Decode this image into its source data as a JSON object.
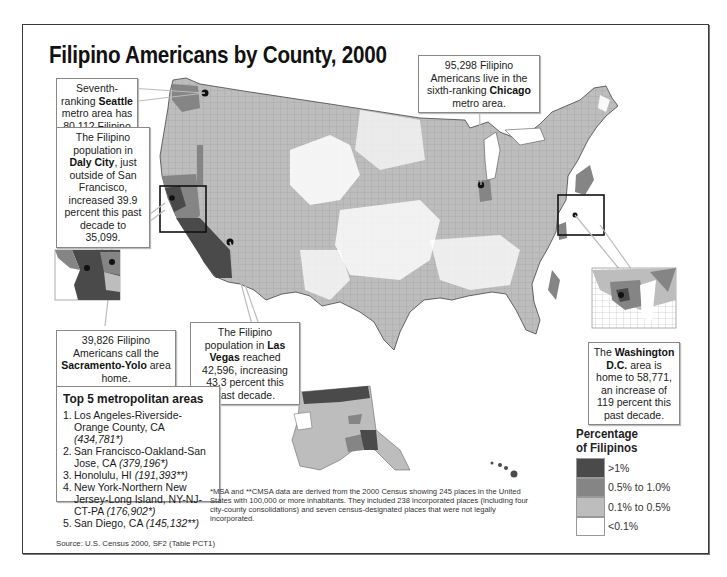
{
  "title": "Filipino Americans by County, 2000",
  "callouts": {
    "seattle": {
      "pre": "Seventh-ranking ",
      "bold": "Seattle",
      "post": " metro area has 80,112 Filipino Americans."
    },
    "daly_city": {
      "pre": "The Filipino population in ",
      "bold": "Daly City",
      "post": ", just outside of San Francisco, increased 39.9 percent this past decade to 35,099."
    },
    "chicago": {
      "pre": "95,298 Filipino Americans live in the sixth-ranking ",
      "bold": "Chicago",
      "post": " metro area."
    },
    "sacramento": {
      "pre": "39,826 Filipino Americans call the ",
      "bold": "Sacramento-Yolo",
      "post": " area home."
    },
    "las_vegas": {
      "pre": "The Filipino population in ",
      "bold": "Las Vegas",
      "post": " reached 42,596, increasing 43.3 percent this past decade."
    },
    "washington": {
      "pre": "The ",
      "bold": "Washington D.C.",
      "post": " area is home to 58,771, an increase of 119 percent this past decade."
    }
  },
  "top5": {
    "heading": "Top 5 metropolitan areas",
    "items": [
      {
        "rank": "1.",
        "name": "Los Angeles-Riverside-Orange County, CA",
        "value": "(434,781*)"
      },
      {
        "rank": "2.",
        "name": "San Francisco-Oakland-San Jose, CA",
        "value": "(379,196*)"
      },
      {
        "rank": "3.",
        "name": "Honolulu, HI",
        "value": "(191,393**)"
      },
      {
        "rank": "4.",
        "name": "New York-Northern New Jersey-Long Island, NY-NJ-CT-PA",
        "value": "(176,902*)"
      },
      {
        "rank": "5.",
        "name": "San Diego, CA",
        "value": "(145,132**)"
      }
    ]
  },
  "footnote": "*MSA and **CMSA data are derived from the 2000 Census showing 245 places in the United States with 100,000 or more inhabitants. They included 238 incorporated places (including four city-county consolidations) and seven census-designated places that were not legally incorporated.",
  "source": "Source: U.S. Census 2000, SF2 (Table PCT1)",
  "legend": {
    "title_line1": "Percentage",
    "title_line2": "of Filipinos",
    "classes": [
      {
        "label": ">1%",
        "color": "#4a4a4a"
      },
      {
        "label": "0.5% to 1.0%",
        "color": "#858585"
      },
      {
        "label": "0.1% to 0.5%",
        "color": "#bdbdbd"
      },
      {
        "label": "<0.1%",
        "color": "#ffffff"
      }
    ]
  },
  "colors": {
    "high": "#4a4a4a",
    "mid": "#858585",
    "low": "#bdbdbd",
    "none": "#ffffff",
    "border": "#555555",
    "frame": "#3a3a3a"
  }
}
